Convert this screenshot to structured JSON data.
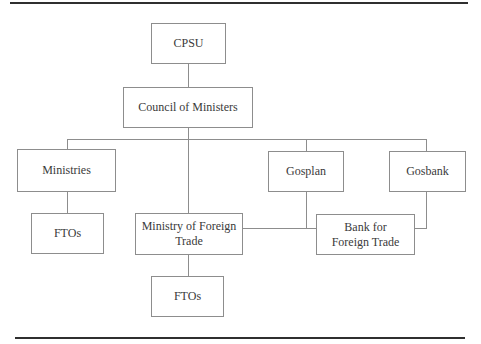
{
  "figure": {
    "type": "org-chart",
    "nodes": {
      "cpsu": {
        "label": "CPSU"
      },
      "council_of_ministers": {
        "label": "Council of Ministers"
      },
      "ministries": {
        "label": "Ministries"
      },
      "ftos_under_ministries": {
        "label": "FTOs"
      },
      "ministry_of_foreign_trade": {
        "label": "Ministry of Foreign\nTrade"
      },
      "gosplan": {
        "label": "Gosplan"
      },
      "gosbank": {
        "label": "Gosbank"
      },
      "bank_for_foreign_trade": {
        "label": "Bank for\nForeign Trade"
      },
      "ftos_under_mft": {
        "label": "FTOs"
      }
    },
    "edges": [
      {
        "from": "CPSU",
        "to": "Council of Ministers"
      },
      {
        "from": "Council of Ministers",
        "to": "Ministries"
      },
      {
        "from": "Council of Ministers",
        "to": "Ministry of Foreign Trade"
      },
      {
        "from": "Council of Ministers",
        "to": "Gosplan"
      },
      {
        "from": "Council of Ministers",
        "to": "Gosbank"
      },
      {
        "from": "Ministries",
        "to": "FTOs"
      },
      {
        "from": "Ministry of Foreign Trade",
        "to": "FTOs"
      },
      {
        "from": "Ministry of Foreign Trade",
        "to": "Bank for Foreign Trade"
      },
      {
        "from": "Gosplan",
        "to": "Bank for Foreign Trade"
      },
      {
        "from": "Gosbank",
        "to": "Bank for Foreign Trade"
      }
    ],
    "colors": {
      "background": "#ffffff",
      "box_border": "#8d8d8d",
      "connector": "#8d8d8d",
      "text": "#3a3a3a",
      "rule": "#2f2f2f"
    }
  }
}
